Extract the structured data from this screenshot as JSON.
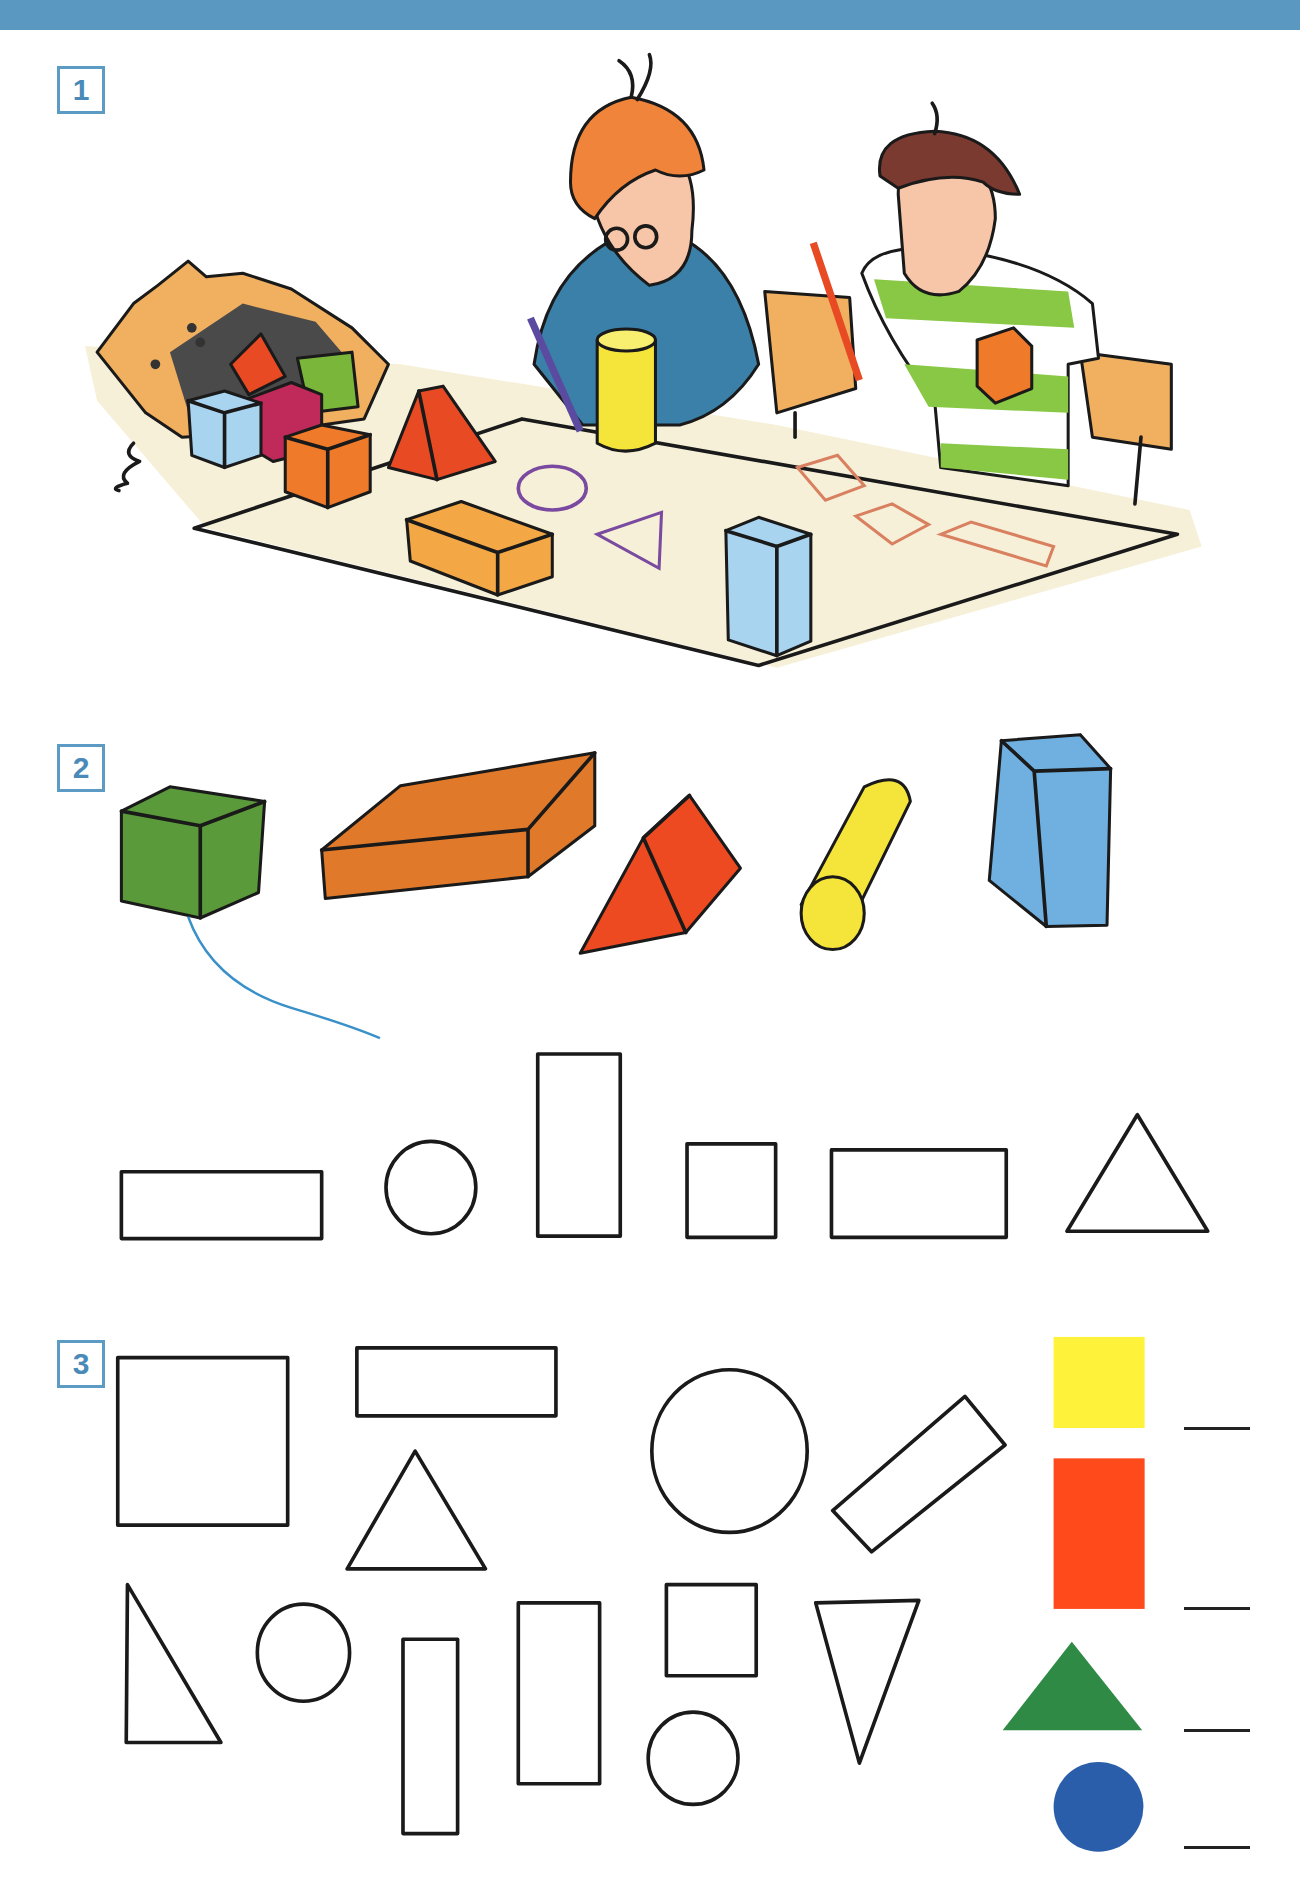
{
  "page": {
    "header_color": "#5a97c1",
    "accent_color": "#4a8ab8"
  },
  "tasks": [
    {
      "number": "1",
      "description": "Illustration: two children at a table tracing outlines of 3D blocks onto paper"
    },
    {
      "number": "2",
      "description": "3D blocks (cube, flat cuboid, triangular prism, cylinder, tall cuboid) to match with flat face outlines"
    },
    {
      "number": "3",
      "description": "Flat shapes to count by type"
    }
  ],
  "task2": {
    "solids": [
      {
        "name": "cube",
        "color": "#5a9a3a"
      },
      {
        "name": "flat-cuboid",
        "color": "#e07a2a"
      },
      {
        "name": "triangular-prism",
        "color": "#ee4a22"
      },
      {
        "name": "cylinder",
        "color": "#f5e53a"
      },
      {
        "name": "tall-cuboid",
        "color": "#6fb0e0"
      }
    ],
    "faces": [
      "wide-rectangle",
      "circle",
      "tall-rectangle",
      "square",
      "rectangle",
      "triangle"
    ],
    "example_line_color": "#3a90c8"
  },
  "task3": {
    "legend": [
      {
        "shape": "square",
        "color": "#fff23a",
        "answer": ""
      },
      {
        "shape": "rectangle",
        "color": "#ff4a1c",
        "answer": ""
      },
      {
        "shape": "triangle",
        "color": "#2e8a44",
        "answer": ""
      },
      {
        "shape": "circle",
        "color": "#2a5eaa",
        "answer": ""
      }
    ]
  }
}
